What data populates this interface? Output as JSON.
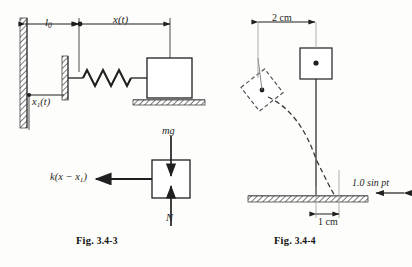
{
  "page": {
    "width": 412,
    "height": 267,
    "background": "#fdfdfb",
    "ink": "#1a1a1a"
  },
  "figures": [
    {
      "id": "fig-3-4-3",
      "caption": "Fig. 3.4-3",
      "caption_prefix": "Fig.",
      "caption_number": "3.4-3",
      "description": "Spring-mass system attached to a movable wall support, with free body diagram",
      "labels": {
        "natural_length": "l",
        "natural_length_sub": "0",
        "displacement": "x(t)",
        "support_motion": "x",
        "support_motion_sub": "1",
        "support_motion_suffix": "(t)",
        "weight": "mg",
        "normal": "N",
        "spring_force": "k(x − x",
        "spring_force_sub": "1",
        "spring_force_suffix": ")"
      }
    },
    {
      "id": "fig-3-4-4",
      "caption": "Fig. 3.4-4",
      "caption_prefix": "Fig.",
      "caption_number": "3.4-4",
      "description": "Pendulum with base excitation showing displaced dashed position and swing arc",
      "labels": {
        "top_dimension": "2 cm",
        "bottom_dimension": "1 cm",
        "forcing": "1.0 sin pt",
        "forcing_amplitude": "1.0",
        "forcing_function": "sin",
        "forcing_argument": "pt"
      }
    }
  ]
}
